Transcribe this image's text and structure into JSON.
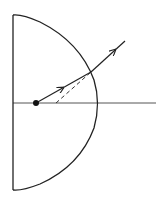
{
  "diagram": {
    "elements": [
      {
        "id": "hemisphere",
        "description": "Hemispherical glass body with flat face on left, curved surface on right"
      },
      {
        "id": "optical-axis",
        "description": "Principal axis through center of flat face"
      },
      {
        "id": "point-object",
        "description": "Point object inside the hemisphere on the axis"
      },
      {
        "id": "incident-ray",
        "description": "Ray travelling from the point object to the curved surface"
      },
      {
        "id": "refracted-ray",
        "description": "Ray emerging from the curved surface, bent away from the normal"
      },
      {
        "id": "virtual-extension",
        "description": "Dashed backward extension of the refracted ray to the axis (virtual image)"
      }
    ],
    "colors": {
      "stroke": "#222222",
      "background": "#ffffff"
    }
  }
}
